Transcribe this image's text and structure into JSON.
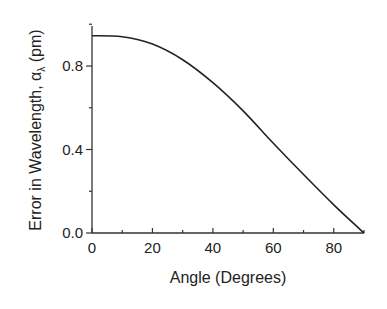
{
  "chart_data": {
    "type": "line",
    "title": "",
    "xlabel": "Angle (Degrees)",
    "ylabel": "Error in Wavelength, α_λ (pm)",
    "ylabel_parts": {
      "prefix": "Error in Wavelength, ",
      "symbol": "α",
      "subscript": "λ",
      "suffix": " (pm)"
    },
    "xlim": [
      0,
      90
    ],
    "ylim": [
      0.0,
      1.0
    ],
    "x_ticks": [
      "0",
      "20",
      "40",
      "60",
      "80"
    ],
    "y_ticks": [
      "0.0",
      "0.4",
      "0.8"
    ],
    "grid": false,
    "legend": null,
    "series": [
      {
        "name": "error",
        "x": [
          0,
          10,
          20,
          30,
          40,
          50,
          60,
          70,
          80,
          90
        ],
        "values": [
          0.945,
          0.94,
          0.905,
          0.83,
          0.72,
          0.585,
          0.43,
          0.28,
          0.135,
          0.0
        ]
      }
    ]
  }
}
